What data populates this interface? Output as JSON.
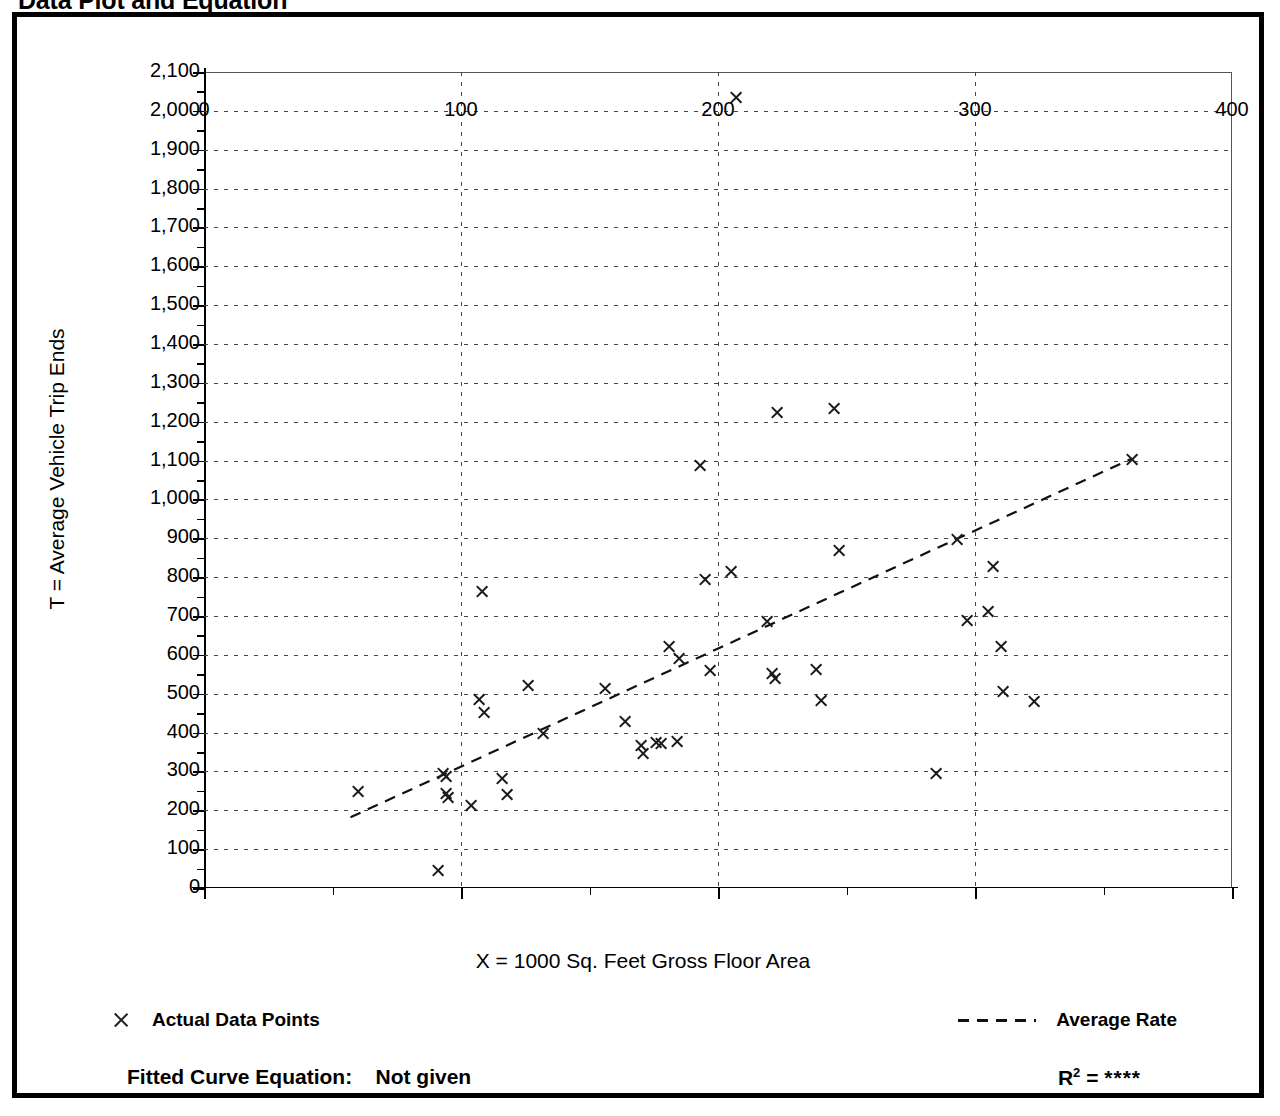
{
  "figure": {
    "title": "Data Plot and Equation"
  },
  "legend": {
    "actual_points_label": "Actual Data Points",
    "average_rate_label": "Average Rate",
    "marker_icon": "x-marker-icon",
    "line_icon": "dashed-line-icon"
  },
  "footer": {
    "fitted_curve_label": "Fitted Curve Equation:",
    "fitted_curve_value": "Not given",
    "r2_symbol": "R",
    "r2_exponent": "2",
    "r2_equals": "=",
    "r2_value": "****"
  },
  "chart_data": {
    "type": "scatter",
    "title": "Data Plot and Equation",
    "xlabel": "X = 1000 Sq. Feet Gross Floor Area",
    "ylabel": "T = Average Vehicle Trip Ends",
    "xlim": [
      0,
      400
    ],
    "ylim": [
      0,
      2100
    ],
    "x_ticks": [
      0,
      100,
      200,
      300,
      400
    ],
    "x_tick_labels": [
      "0",
      "100",
      "200",
      "300",
      "400"
    ],
    "x_minor_step": 50,
    "y_ticks": [
      0,
      100,
      200,
      300,
      400,
      500,
      600,
      700,
      800,
      900,
      1000,
      1100,
      1200,
      1300,
      1400,
      1500,
      1600,
      1700,
      1800,
      1900,
      2000,
      2100
    ],
    "y_tick_labels": [
      "0",
      "100",
      "200",
      "300",
      "400",
      "500",
      "600",
      "700",
      "800",
      "900",
      "1,000",
      "1,100",
      "1,200",
      "1,300",
      "1,400",
      "1,500",
      "1,600",
      "1,700",
      "1,800",
      "1,900",
      "2,000",
      "2,100"
    ],
    "y_minor_step": 50,
    "grid": "dotted-horizontal-and-vertical",
    "legend_position": "below-plot",
    "series": [
      {
        "name": "Actual Data Points",
        "marker": "x",
        "points": [
          [
            60,
            248
          ],
          [
            91,
            46
          ],
          [
            93,
            295
          ],
          [
            94,
            288
          ],
          [
            94,
            243
          ],
          [
            95,
            232
          ],
          [
            104,
            213
          ],
          [
            107,
            484
          ],
          [
            108,
            762
          ],
          [
            109,
            452
          ],
          [
            116,
            282
          ],
          [
            118,
            240
          ],
          [
            126,
            521
          ],
          [
            132,
            398
          ],
          [
            156,
            514
          ],
          [
            164,
            428
          ],
          [
            170,
            368
          ],
          [
            171,
            345
          ],
          [
            176,
            375
          ],
          [
            178,
            373
          ],
          [
            181,
            621
          ],
          [
            184,
            378
          ],
          [
            185,
            591
          ],
          [
            193,
            1087
          ],
          [
            195,
            795
          ],
          [
            197,
            561
          ],
          [
            205,
            815
          ],
          [
            207,
            2035
          ],
          [
            219,
            686
          ],
          [
            221,
            553
          ],
          [
            222,
            538
          ],
          [
            223,
            1225
          ],
          [
            238,
            562
          ],
          [
            240,
            482
          ],
          [
            245,
            1233
          ],
          [
            247,
            869
          ],
          [
            285,
            294
          ],
          [
            293,
            897
          ],
          [
            297,
            688
          ],
          [
            305,
            712
          ],
          [
            307,
            828
          ],
          [
            310,
            622
          ],
          [
            311,
            505
          ],
          [
            323,
            481
          ],
          [
            361,
            1103
          ]
        ]
      }
    ],
    "trendline": {
      "name": "Average Rate",
      "style": "dashed",
      "x_start": 57,
      "y_start": 182,
      "x_end": 361,
      "y_end": 1105
    }
  }
}
